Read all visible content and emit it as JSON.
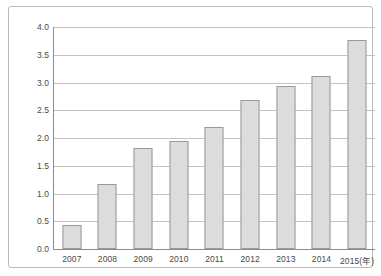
{
  "chart_data": {
    "type": "bar",
    "title": "",
    "subtitle": "",
    "xlabel": "(年)",
    "ylabel": "",
    "categories": [
      "2007",
      "2008",
      "2009",
      "2010",
      "2011",
      "2012",
      "2013",
      "2014",
      "2015"
    ],
    "tick_labels_x": [
      "2007",
      "2008",
      "2009",
      "2010",
      "2011",
      "2012",
      "2013",
      "2014",
      "2015(年)"
    ],
    "values": [
      0.43,
      1.17,
      1.82,
      1.95,
      2.2,
      2.68,
      2.94,
      3.12,
      3.77
    ],
    "ylim": [
      0.0,
      4.0
    ],
    "ytick_values": [
      0.0,
      0.5,
      1.0,
      1.5,
      2.0,
      2.5,
      3.0,
      3.5,
      4.0
    ],
    "ytick_labels": [
      "0.0",
      "0.5",
      "1.0",
      "1.5",
      "2.0",
      "2.5",
      "3.0",
      "3.5",
      "4.0"
    ],
    "grid": true,
    "legend": null,
    "legend_position": "none",
    "series": [
      {
        "name": "",
        "values": [
          0.43,
          1.17,
          1.82,
          1.95,
          2.2,
          2.68,
          2.94,
          3.12,
          3.77
        ]
      }
    ],
    "colors": {
      "bar_fill": "#dcdcdc",
      "bar_edge": "#9a9a9a",
      "gridline": "#c3c3c3",
      "axis": "#8c8c8c",
      "frame": "#b9b9b9",
      "label_text": "#4a4a4a",
      "background": "#ffffff"
    }
  }
}
